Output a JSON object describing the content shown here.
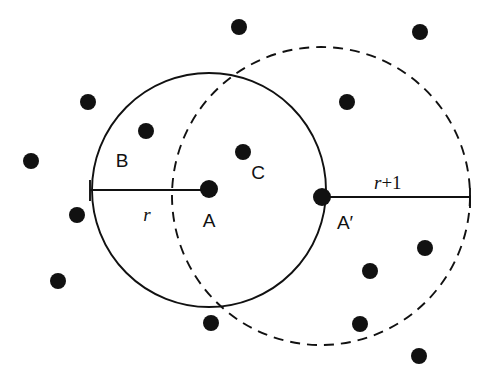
{
  "figure": {
    "background_color": "#ffffff",
    "stroke_color": "#111111",
    "dot_color": "#111111",
    "labels": {
      "region_b": "B",
      "region_c": "C",
      "center_a": "A",
      "point_a_prime": "A′",
      "radius_r": "r",
      "radius_r_plus_1_var": "r",
      "radius_r_plus_1_rest": "+1"
    }
  },
  "chart_data": {
    "type": "scatter",
    "title": "",
    "xlabel": "",
    "ylabel": "",
    "xlim": [
      0,
      501
    ],
    "ylim": [
      0,
      374
    ],
    "grid": false,
    "legend": "none",
    "circles": [
      {
        "name": "circle-a-solid",
        "style": "solid",
        "center": [
          209,
          190
        ],
        "radius": 117,
        "center_label": "A",
        "radius_label": "r"
      },
      {
        "name": "circle-a-prime-dashed",
        "style": "dashed",
        "center": [
          321,
          196
        ],
        "radius": 149,
        "center_label": "A′",
        "radius_label": "r+1"
      }
    ],
    "marked_points": [
      {
        "name": "A",
        "x": 209,
        "y": 189
      },
      {
        "name": "A′",
        "x": 322,
        "y": 197
      }
    ],
    "radius_segments": [
      {
        "name": "r-segment",
        "from": [
          90,
          190
        ],
        "to": [
          209,
          190
        ],
        "label": "r",
        "tick_at_start": true
      },
      {
        "name": "r-plus-1-segment",
        "from": [
          322,
          197
        ],
        "to": [
          470,
          197
        ],
        "label": "r+1",
        "tick_at_end": true
      }
    ],
    "region_labels": [
      {
        "name": "B",
        "x": 122,
        "y": 160
      },
      {
        "name": "C",
        "x": 258,
        "y": 172
      },
      {
        "name": "A",
        "x": 209,
        "y": 220
      },
      {
        "name": "A′",
        "x": 345,
        "y": 222
      }
    ],
    "points": [
      {
        "x": 239,
        "y": 27,
        "r": 8
      },
      {
        "x": 420,
        "y": 32,
        "r": 8
      },
      {
        "x": 88,
        "y": 102,
        "r": 8
      },
      {
        "x": 347,
        "y": 102,
        "r": 8
      },
      {
        "x": 146,
        "y": 131,
        "r": 8
      },
      {
        "x": 31,
        "y": 161,
        "r": 8
      },
      {
        "x": 243,
        "y": 152,
        "r": 8
      },
      {
        "x": 77,
        "y": 215,
        "r": 8
      },
      {
        "x": 425,
        "y": 248,
        "r": 8
      },
      {
        "x": 58,
        "y": 281,
        "r": 8
      },
      {
        "x": 370,
        "y": 271,
        "r": 8
      },
      {
        "x": 211,
        "y": 323,
        "r": 8
      },
      {
        "x": 360,
        "y": 324,
        "r": 8
      },
      {
        "x": 419,
        "y": 356,
        "r": 8
      }
    ],
    "point_count": 14
  }
}
